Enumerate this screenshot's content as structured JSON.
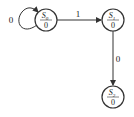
{
  "diagram": {
    "type": "state-machine",
    "states": [
      {
        "id": "S0",
        "name": "S",
        "sub": "0",
        "output": "0",
        "cx": 46,
        "cy": 20
      },
      {
        "id": "S1",
        "name": "S",
        "sub": "1",
        "output": "0",
        "cx": 113,
        "cy": 20
      },
      {
        "id": "S2",
        "name": "S",
        "sub": "2",
        "output": "0",
        "cx": 113,
        "cy": 97
      }
    ],
    "transitions": [
      {
        "from": "S0",
        "to": "S0",
        "label": "0"
      },
      {
        "from": "S0",
        "to": "S1",
        "label": "1"
      },
      {
        "from": "S1",
        "to": "S2",
        "label": "0"
      }
    ]
  }
}
